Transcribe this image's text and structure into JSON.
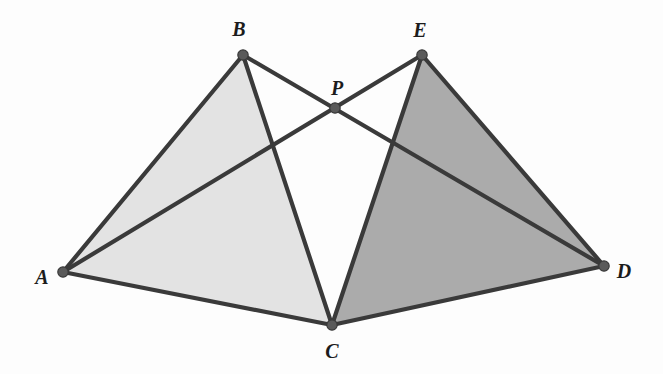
{
  "figure": {
    "background_color": "#fdfdfd",
    "canvas": {
      "width": 663,
      "height": 374
    },
    "stroke": {
      "color": "#3a3a3a",
      "width": 4.2,
      "linecap": "round",
      "linejoin": "round"
    },
    "node": {
      "fill": "#5a5a5a",
      "stroke": "#3a3a3a",
      "stroke_width": 1.2,
      "radius": 5.2
    }
  },
  "points": [
    {
      "id": "A",
      "label": "A",
      "x": 63,
      "y": 272,
      "label_x": 42,
      "label_y": 277
    },
    {
      "id": "B",
      "label": "B",
      "x": 243,
      "y": 55,
      "label_x": 239,
      "label_y": 29
    },
    {
      "id": "C",
      "label": "C",
      "x": 332,
      "y": 325,
      "label_x": 332,
      "label_y": 351
    },
    {
      "id": "D",
      "label": "D",
      "x": 604,
      "y": 266,
      "label_x": 624,
      "label_y": 271
    },
    {
      "id": "E",
      "label": "E",
      "x": 422,
      "y": 55,
      "label_x": 420,
      "label_y": 30
    },
    {
      "id": "P",
      "label": "P",
      "x": 335,
      "y": 108,
      "label_x": 337,
      "label_y": 88
    }
  ],
  "regions": [
    {
      "id": "triangle-abc",
      "name": "triangle-abc",
      "vertices": [
        "A",
        "B",
        "C"
      ],
      "fill": "#e3e3e3",
      "description": "light gray shaded triangle ABC"
    },
    {
      "id": "triangle-ced",
      "name": "triangle-ced",
      "vertices": [
        "C",
        "E",
        "D"
      ],
      "fill": "#ababab",
      "description": "darker gray shaded triangle CED"
    }
  ],
  "segments": [
    {
      "id": "AB",
      "from": "A",
      "to": "B"
    },
    {
      "id": "BC",
      "from": "B",
      "to": "C"
    },
    {
      "id": "CA",
      "from": "C",
      "to": "A"
    },
    {
      "id": "CE",
      "from": "C",
      "to": "E"
    },
    {
      "id": "ED",
      "from": "E",
      "to": "D"
    },
    {
      "id": "DC",
      "from": "D",
      "to": "C"
    },
    {
      "id": "BD",
      "from": "B",
      "to": "D"
    },
    {
      "id": "EA",
      "from": "E",
      "to": "A"
    }
  ],
  "intersections": [
    {
      "id": "P",
      "x": 335,
      "y": 108,
      "of": [
        "BD",
        "EA"
      ],
      "marked": true
    },
    {
      "id": "X1",
      "x": 272,
      "y": 151,
      "of": [
        "EA",
        "BC"
      ],
      "marked": false
    },
    {
      "id": "X2",
      "x": 395,
      "y": 152,
      "of": [
        "BD",
        "CE"
      ],
      "marked": false
    }
  ]
}
